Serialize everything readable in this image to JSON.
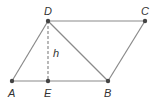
{
  "diagram": {
    "type": "parallelogram",
    "colors": {
      "line": "#8a8a8a",
      "point": "#444444",
      "label": "#333333"
    },
    "points": {
      "A": {
        "label": "A",
        "x": 12,
        "y": 81
      },
      "E": {
        "label": "E",
        "x": 48,
        "y": 81
      },
      "B": {
        "label": "B",
        "x": 108,
        "y": 81
      },
      "D": {
        "label": "D",
        "x": 48,
        "y": 21
      },
      "C": {
        "label": "C",
        "x": 145,
        "y": 21
      }
    },
    "segments": [
      {
        "from": "A",
        "to": "B",
        "style": "solid"
      },
      {
        "from": "D",
        "to": "C",
        "style": "solid"
      },
      {
        "from": "A",
        "to": "D",
        "style": "solid"
      },
      {
        "from": "B",
        "to": "C",
        "style": "solid"
      },
      {
        "from": "D",
        "to": "B",
        "style": "solid"
      },
      {
        "from": "D",
        "to": "E",
        "style": "dashed"
      }
    ],
    "height_label": "h"
  }
}
